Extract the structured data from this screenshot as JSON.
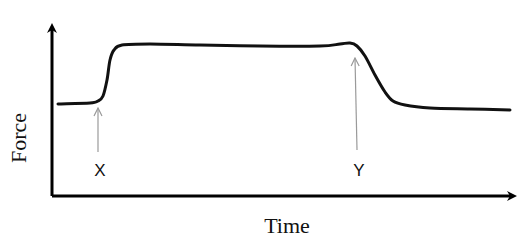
{
  "chart_data": {
    "type": "line",
    "title": "",
    "xlabel": "Time",
    "ylabel": "Force",
    "grid": false,
    "ticks": false,
    "series": [
      {
        "name": "force",
        "points_px": [
          [
            58,
            104
          ],
          [
            90,
            103
          ],
          [
            98,
            101
          ],
          [
            103,
            96
          ],
          [
            107,
            80
          ],
          [
            110,
            60
          ],
          [
            114,
            50
          ],
          [
            122,
            45
          ],
          [
            150,
            44
          ],
          [
            200,
            45
          ],
          [
            260,
            46
          ],
          [
            320,
            46
          ],
          [
            340,
            44
          ],
          [
            350,
            43
          ],
          [
            357,
            46
          ],
          [
            365,
            56
          ],
          [
            375,
            75
          ],
          [
            385,
            92
          ],
          [
            393,
            101
          ],
          [
            405,
            105
          ],
          [
            430,
            108
          ],
          [
            470,
            109
          ],
          [
            510,
            110
          ]
        ]
      }
    ],
    "annotations": [
      {
        "label": "X",
        "arrow_from": [
          98,
          152
        ],
        "arrow_to": [
          98,
          108
        ],
        "text_pos": [
          100,
          176
        ],
        "meaning": "onset of force rise"
      },
      {
        "label": "Y",
        "arrow_from": [
          357,
          150
        ],
        "arrow_to": [
          355,
          58
        ],
        "text_pos": [
          359,
          176
        ],
        "meaning": "onset of force drop"
      }
    ],
    "axes": {
      "y_axis": {
        "x": 52,
        "from_y": 196,
        "to_y": 24
      },
      "x_axis": {
        "y": 196,
        "from_x": 52,
        "to_x": 518
      }
    }
  },
  "labels": {
    "x_axis": "Time",
    "y_axis": "Force",
    "marker_x": "X",
    "marker_y": "Y"
  },
  "colors": {
    "curve": "#111111",
    "axes": "#000000",
    "annotation_arrow": "#9a9a9a",
    "background": "#ffffff"
  }
}
